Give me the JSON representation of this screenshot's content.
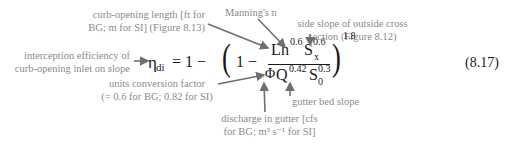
{
  "equation": {
    "lhs_symbol": "η",
    "lhs_subscript": "di",
    "equals_one_minus": "= 1 −",
    "inner_one_minus": "1 −",
    "numerator": {
      "L": "L",
      "h": "h",
      "h_exp": "0.6",
      "S": "S",
      "S_sub": "x",
      "S_exp": "0.6"
    },
    "denominator": {
      "phi": "Φ",
      "Q": "Q",
      "Q_exp": "0.42",
      "S": "S",
      "S_sub": "0",
      "S_exp": "0.3"
    },
    "outer_exponent": "1.8",
    "number": "(8.17)"
  },
  "annotations": {
    "curb_opening_length": [
      "curb-opening length [ft for",
      "BG; m for SI] (Figure 8.13)"
    ],
    "mannings_n": "Manning's n",
    "side_slope": [
      "side slope of outside cross",
      "section (Figure 8.12)"
    ],
    "interception_efficiency": [
      "interception efficiency of",
      "curb-opening inlet on slope"
    ],
    "units_conversion": [
      "units conversion factor",
      "(= 0.6 for BG; 0.82 for SI)"
    ],
    "gutter_bed_slope": "gutter bed slope",
    "discharge": [
      "discharge in gutter [cfs",
      "for BG; m³ s⁻¹ for SI]"
    ]
  },
  "colors": {
    "annotation_text": "#8a8a8a",
    "arrow": "#6e6e6e",
    "equation": "#1a1a1a"
  }
}
